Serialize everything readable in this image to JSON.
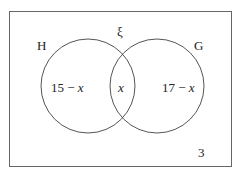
{
  "diagram": {
    "type": "venn",
    "universal_symbol": "ξ",
    "sets": [
      {
        "name": "H",
        "label": "H"
      },
      {
        "name": "G",
        "label": "G"
      }
    ],
    "regions": {
      "h_only": {
        "num": "15 − ",
        "var": "x"
      },
      "intersection": {
        "var": "x"
      },
      "g_only": {
        "num": "17 − ",
        "var": "x"
      },
      "outside": "3"
    },
    "colors": {
      "stroke": "#555555",
      "text": "#222222",
      "background": "#ffffff"
    }
  }
}
